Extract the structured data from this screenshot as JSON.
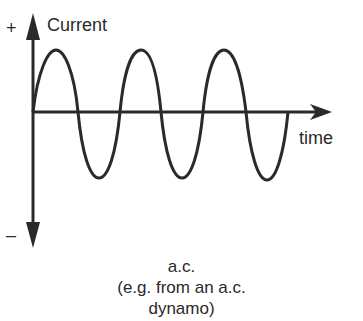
{
  "diagram": {
    "type": "waveform",
    "axes": {
      "y_label": "Current",
      "x_label": "time",
      "positive_sign": "+",
      "negative_sign": "–"
    },
    "waveform": {
      "shape": "sine",
      "cycles": 3,
      "color": "#2a2a2a"
    },
    "caption": {
      "line1": "a.c.",
      "line2": "(e.g. from an a.c.",
      "line3": "dynamo)"
    }
  }
}
